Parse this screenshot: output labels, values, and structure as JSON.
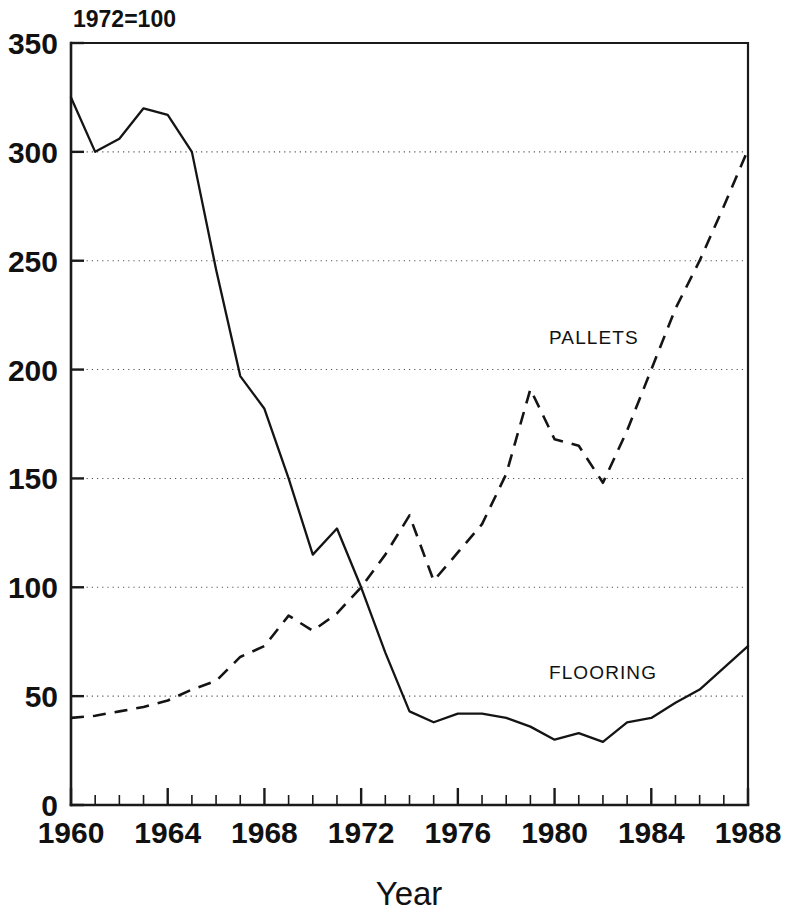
{
  "note": {
    "text": "1972=100"
  },
  "axes": {
    "x": {
      "label": "Year",
      "ticks": [
        1960,
        1964,
        1968,
        1972,
        1976,
        1980,
        1984,
        1988
      ],
      "tick_labels": [
        "1960",
        "1964",
        "1968",
        "1972",
        "1976",
        "1980",
        "1984",
        "1988"
      ],
      "min": 1960,
      "max": 1988,
      "minor_step": 1
    },
    "y": {
      "label": "",
      "ticks": [
        0,
        50,
        100,
        150,
        200,
        250,
        300,
        350
      ],
      "tick_labels": [
        "0",
        "50",
        "100",
        "150",
        "200",
        "250",
        "300",
        "350"
      ],
      "min": 0,
      "max": 350
    }
  },
  "series_labels": {
    "pallets": "PALLETS",
    "flooring": "FLOORING"
  },
  "colors": {
    "ink": "#141414",
    "grid": "#565656",
    "background": "#ffffff"
  },
  "chart_data": {
    "type": "line",
    "title": "",
    "subtitle": "1972=100",
    "xlabel": "Year",
    "ylabel": "",
    "xlim": [
      1960,
      1988
    ],
    "ylim": [
      0,
      350
    ],
    "grid": true,
    "grid_axis": "y",
    "grid_style": "dotted",
    "legend": "inline-labels",
    "x": [
      1960,
      1961,
      1962,
      1963,
      1964,
      1965,
      1966,
      1967,
      1968,
      1969,
      1970,
      1971,
      1972,
      1973,
      1974,
      1975,
      1976,
      1977,
      1978,
      1979,
      1980,
      1981,
      1982,
      1983,
      1984,
      1985,
      1986,
      1987,
      1988
    ],
    "series": [
      {
        "name": "FLOORING",
        "style": "solid",
        "values": [
          325,
          300,
          306,
          320,
          317,
          300,
          246,
          197,
          182,
          150,
          115,
          127,
          100,
          70,
          43,
          38,
          42,
          42,
          40,
          36,
          30,
          33,
          29,
          38,
          40,
          47,
          53,
          63,
          73
        ]
      },
      {
        "name": "PALLETS",
        "style": "dashed",
        "values": [
          40,
          41,
          43,
          45,
          48,
          53,
          57,
          68,
          73,
          87,
          80,
          88,
          100,
          115,
          133,
          103,
          116,
          129,
          152,
          191,
          168,
          165,
          148,
          172,
          200,
          228,
          250,
          275,
          301
        ]
      }
    ],
    "annotations": [
      {
        "text": "PALLETS",
        "x": 1979.0,
        "y": 215
      },
      {
        "text": "FLOORING",
        "x": 1979.0,
        "y": 77
      },
      {
        "text": "1972=100",
        "x": 1960.6,
        "y": 362
      }
    ]
  }
}
